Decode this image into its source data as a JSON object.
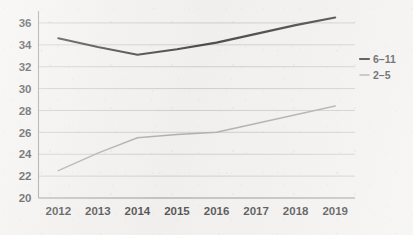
{
  "chart_data": {
    "type": "line",
    "title": "",
    "subtitle": "",
    "xlabel": "",
    "ylabel": "",
    "categories": [
      "2012",
      "2013",
      "2014",
      "2015",
      "2016",
      "2017",
      "2018",
      "2019"
    ],
    "x": [
      2012,
      2013,
      2014,
      2015,
      2016,
      2017,
      2018,
      2019
    ],
    "series": [
      {
        "name": "6-11",
        "label": "6–11",
        "color": "#121212",
        "stroke_width": 2.1,
        "values": [
          34.6,
          33.8,
          33.1,
          33.6,
          34.2,
          35.0,
          35.8,
          36.5
        ]
      },
      {
        "name": "2-5",
        "label": "2–5",
        "color": "#9a9a98",
        "stroke_width": 1.5,
        "values": [
          22.5,
          24.1,
          25.5,
          25.8,
          26.0,
          26.8,
          27.6,
          28.4
        ]
      }
    ],
    "ylim": [
      20,
      37
    ],
    "y_ticks": [
      20,
      22,
      24,
      26,
      28,
      30,
      32,
      34,
      36
    ],
    "y_tick_labels": [
      "20",
      "22",
      "24",
      "26",
      "28",
      "30",
      "32",
      "34",
      "36"
    ],
    "grid": true,
    "grid_axis": "y",
    "legend_position": "right",
    "background_color": "#f2f1ef",
    "gridline_color": "#b9b9b7",
    "axis_color": "#8d8d8b"
  },
  "legend": {
    "entries": [
      {
        "label": "6–11",
        "color": "#121212"
      },
      {
        "label": "2–5",
        "color": "#9a9a98"
      }
    ]
  }
}
